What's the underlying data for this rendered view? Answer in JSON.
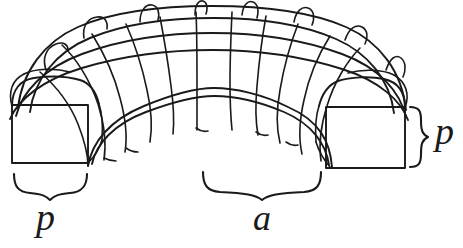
{
  "figure": {
    "background_color": "#ffffff",
    "stroke_color": "#1a1a1a",
    "stroke_width": 1.8,
    "labels": [
      {
        "id": "p-bottom",
        "text": "p",
        "name": "dimension-label-p-bottom",
        "meaning": "width of the square cross-section measured along the base",
        "x": 36,
        "y": 198,
        "font_size": 38,
        "italic": true
      },
      {
        "id": "a-bottom",
        "text": "a",
        "name": "dimension-label-a-bottom",
        "meaning": "inner span (clear opening) of the arch",
        "x": 253,
        "y": 200,
        "font_size": 36,
        "italic": true
      },
      {
        "id": "p-right",
        "text": "p",
        "name": "dimension-label-p-right",
        "meaning": "height/depth of the square cross-section at the springing",
        "x": 435,
        "y": 112,
        "font_size": 38,
        "italic": true
      }
    ],
    "braces": [
      {
        "id": "brace-bottom-left",
        "name": "brace-bottom-left",
        "orientation": "down",
        "from_x": 14,
        "to_x": 88,
        "y": 173,
        "labels": "p"
      },
      {
        "id": "brace-bottom-center",
        "name": "brace-bottom-center",
        "orientation": "down",
        "from_x": 202,
        "to_x": 322,
        "y": 171,
        "labels": "a"
      },
      {
        "id": "brace-right",
        "name": "brace-right-side",
        "orientation": "right",
        "from_y": 107,
        "to_y": 168,
        "x": 412,
        "labels": "p"
      }
    ],
    "geometry": {
      "left_face": {
        "x": 12,
        "y": 105,
        "width": 76,
        "height": 58
      },
      "right_face": {
        "x": 326,
        "y": 107,
        "width": 79,
        "height": 61
      },
      "rib_count": 11,
      "top_loop_count": 7,
      "arch_outer_top_y": 22,
      "arch_inner_top_y": 76,
      "arch_center_x": 212
    }
  }
}
